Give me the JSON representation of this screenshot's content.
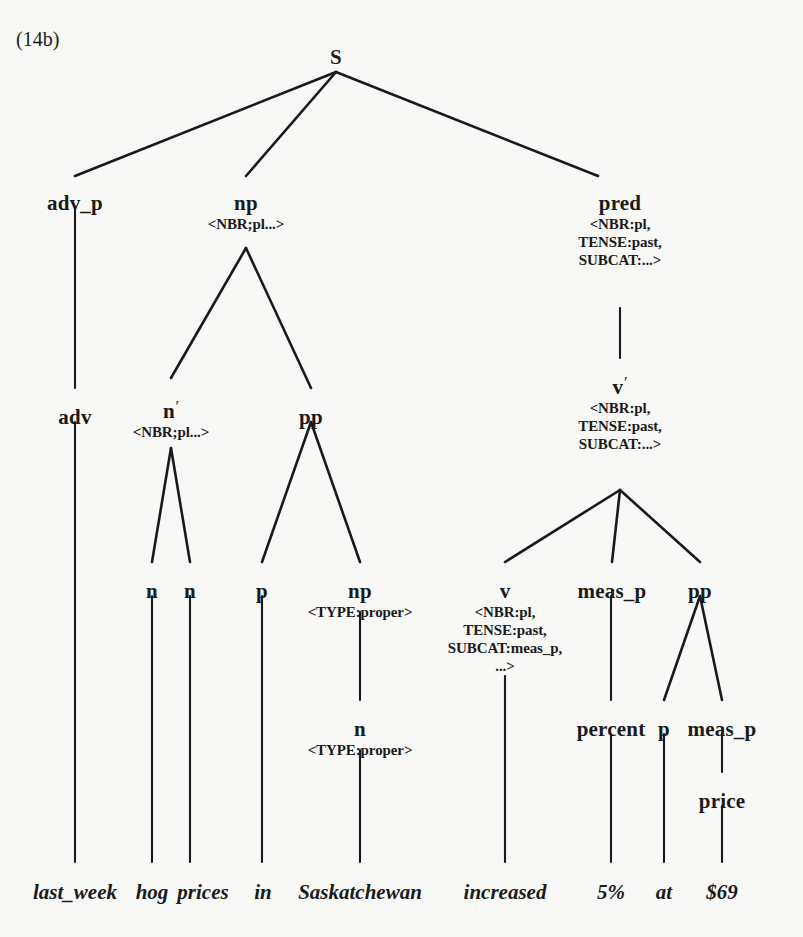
{
  "figure": {
    "label": "(14b)",
    "type": "syntactic parse tree",
    "background_color": "#f8f8f6",
    "ink_color": "#1a1a1a"
  },
  "tree": {
    "nodes": [
      {
        "id": "s",
        "label": "S",
        "features": [],
        "x": 336,
        "y": 46
      },
      {
        "id": "adv_p",
        "label": "adv_p",
        "features": [],
        "x": 75,
        "y": 192
      },
      {
        "id": "np1",
        "label": "np",
        "features": [
          "<NBR;pl...>"
        ],
        "x": 246,
        "y": 192
      },
      {
        "id": "pred",
        "label": "pred",
        "features": [
          "<NBR:pl,",
          "TENSE:past,",
          "SUBCAT:...>"
        ],
        "x": 620,
        "y": 192
      },
      {
        "id": "adv",
        "label": "adv",
        "features": [],
        "x": 75,
        "y": 406
      },
      {
        "id": "nbar",
        "label": "n'",
        "features": [
          "<NBR;pl...>"
        ],
        "x": 171,
        "y": 398
      },
      {
        "id": "pp1",
        "label": "pp",
        "features": [],
        "x": 311,
        "y": 406
      },
      {
        "id": "vbar",
        "label": "v'",
        "features": [
          "<NBR:pl,",
          "TENSE:past,",
          "SUBCAT:...>"
        ],
        "x": 620,
        "y": 374
      },
      {
        "id": "n1",
        "label": "n",
        "features": [],
        "x": 152,
        "y": 580
      },
      {
        "id": "n2",
        "label": "n",
        "features": [],
        "x": 190,
        "y": 580
      },
      {
        "id": "p1",
        "label": "p",
        "features": [],
        "x": 262,
        "y": 580
      },
      {
        "id": "np2",
        "label": "np",
        "features": [
          "<TYPE:proper>"
        ],
        "x": 360,
        "y": 580
      },
      {
        "id": "v",
        "label": "v",
        "features": [
          "<NBR:pl,",
          "TENSE:past,",
          "SUBCAT:meas_p,",
          "...>"
        ],
        "x": 505,
        "y": 580
      },
      {
        "id": "meas_p1",
        "label": "meas_p",
        "features": [],
        "x": 612,
        "y": 580
      },
      {
        "id": "pp2",
        "label": "pp",
        "features": [],
        "x": 700,
        "y": 580
      },
      {
        "id": "n3",
        "label": "n",
        "features": [
          "<TYPE:proper>"
        ],
        "x": 360,
        "y": 718
      },
      {
        "id": "percent",
        "label": "percent",
        "features": [],
        "x": 611,
        "y": 718
      },
      {
        "id": "p2",
        "label": "p",
        "features": [],
        "x": 664,
        "y": 718
      },
      {
        "id": "meas_p2",
        "label": "meas_p",
        "features": [],
        "x": 722,
        "y": 718
      },
      {
        "id": "price",
        "label": "price",
        "features": [],
        "x": 722,
        "y": 790
      }
    ],
    "edges": [
      {
        "from": "s",
        "to": "adv_p",
        "x1": 336,
        "y1": 72,
        "x2": 75,
        "y2": 176
      },
      {
        "from": "s",
        "to": "np1",
        "x1": 336,
        "y1": 72,
        "x2": 246,
        "y2": 176
      },
      {
        "from": "s",
        "to": "pred",
        "x1": 336,
        "y1": 72,
        "x2": 598,
        "y2": 176
      },
      {
        "from": "adv_p",
        "to": "adv",
        "x1": 75,
        "y1": 208,
        "x2": 75,
        "y2": 388
      },
      {
        "from": "np1",
        "to": "nbar",
        "x1": 246,
        "y1": 248,
        "x2": 171,
        "y2": 378
      },
      {
        "from": "np1",
        "to": "pp1",
        "x1": 246,
        "y1": 248,
        "x2": 311,
        "y2": 388
      },
      {
        "from": "pred",
        "to": "vbar",
        "x1": 620,
        "y1": 308,
        "x2": 620,
        "y2": 358
      },
      {
        "from": "nbar",
        "to": "n1",
        "x1": 171,
        "y1": 448,
        "x2": 152,
        "y2": 562
      },
      {
        "from": "nbar",
        "to": "n2",
        "x1": 171,
        "y1": 448,
        "x2": 190,
        "y2": 562
      },
      {
        "from": "pp1",
        "to": "p1",
        "x1": 311,
        "y1": 422,
        "x2": 262,
        "y2": 562
      },
      {
        "from": "pp1",
        "to": "np2",
        "x1": 311,
        "y1": 422,
        "x2": 360,
        "y2": 562
      },
      {
        "from": "vbar",
        "to": "v",
        "x1": 620,
        "y1": 490,
        "x2": 505,
        "y2": 562
      },
      {
        "from": "vbar",
        "to": "meas_p1",
        "x1": 620,
        "y1": 490,
        "x2": 612,
        "y2": 562
      },
      {
        "from": "vbar",
        "to": "pp2",
        "x1": 620,
        "y1": 490,
        "x2": 700,
        "y2": 562
      },
      {
        "from": "np2",
        "to": "n3",
        "x1": 360,
        "y1": 612,
        "x2": 360,
        "y2": 700
      },
      {
        "from": "v",
        "to": "vword",
        "x1": 505,
        "y1": 676,
        "x2": 505,
        "y2": 862
      },
      {
        "from": "meas_p1",
        "to": "percent",
        "x1": 611,
        "y1": 596,
        "x2": 611,
        "y2": 700
      },
      {
        "from": "pp2",
        "to": "p2",
        "x1": 700,
        "y1": 596,
        "x2": 664,
        "y2": 700
      },
      {
        "from": "pp2",
        "to": "meas_p2",
        "x1": 700,
        "y1": 596,
        "x2": 722,
        "y2": 700
      },
      {
        "from": "meas_p2",
        "to": "price",
        "x1": 722,
        "y1": 734,
        "x2": 722,
        "y2": 772
      },
      {
        "from": "n3",
        "to": "sask",
        "x1": 360,
        "y1": 750,
        "x2": 360,
        "y2": 862
      },
      {
        "from": "adv",
        "to": "lastweek",
        "x1": 75,
        "y1": 422,
        "x2": 75,
        "y2": 862
      },
      {
        "from": "n1",
        "to": "hog",
        "x1": 152,
        "y1": 596,
        "x2": 152,
        "y2": 862
      },
      {
        "from": "n2",
        "to": "prices",
        "x1": 190,
        "y1": 596,
        "x2": 190,
        "y2": 862
      },
      {
        "from": "p1",
        "to": "in",
        "x1": 262,
        "y1": 596,
        "x2": 262,
        "y2": 862
      },
      {
        "from": "percent",
        "to": "fivepct",
        "x1": 611,
        "y1": 734,
        "x2": 611,
        "y2": 862
      },
      {
        "from": "p2",
        "to": "at",
        "x1": 664,
        "y1": 734,
        "x2": 664,
        "y2": 862
      },
      {
        "from": "price",
        "to": "dollar69",
        "x1": 722,
        "y1": 806,
        "x2": 722,
        "y2": 862
      }
    ],
    "terminals": [
      {
        "id": "lastweek",
        "text": "last_week",
        "x": 75,
        "y": 880
      },
      {
        "id": "hog",
        "text": "hog",
        "x": 152,
        "y": 880
      },
      {
        "id": "prices",
        "text": "prices",
        "x": 203,
        "y": 880
      },
      {
        "id": "in",
        "text": "in",
        "x": 263,
        "y": 880
      },
      {
        "id": "sask",
        "text": "Saskatchewan",
        "x": 360,
        "y": 880
      },
      {
        "id": "vword",
        "text": "increased",
        "x": 505,
        "y": 880
      },
      {
        "id": "fivepct",
        "text": "5%",
        "x": 611,
        "y": 880
      },
      {
        "id": "at",
        "text": "at",
        "x": 664,
        "y": 880
      },
      {
        "id": "dollar69",
        "text": "$69",
        "x": 722,
        "y": 880
      }
    ],
    "sentence": "last_week hog prices in Saskatchewan increased 5% at $69"
  }
}
